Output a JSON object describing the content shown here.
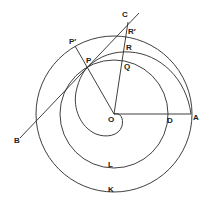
{
  "diagram": {
    "type": "geometric construction (Archimedean spiral with tangent)",
    "stroke_color": "#2a2a2a",
    "background": "#ffffff",
    "labels": {
      "C": "C",
      "R_prime": "R′",
      "R": "R",
      "Q": "Q",
      "P_prime": "P′",
      "P": "P",
      "O": "O",
      "D": "D",
      "A": "A",
      "B": "B",
      "L": "L",
      "K": "K"
    },
    "points": {
      "O": [
        114,
        114
      ],
      "A": [
        191,
        114
      ],
      "D": [
        166,
        114
      ],
      "P": [
        88,
        67
      ],
      "P_prime": [
        75,
        46
      ],
      "C": [
        127,
        20
      ],
      "R_prime": [
        128,
        36
      ],
      "R": [
        129,
        52
      ],
      "Q": [
        128,
        60
      ],
      "B": [
        20,
        138
      ]
    },
    "circles": [
      {
        "name": "outer-circle-K",
        "center": [
          114,
          114
        ],
        "radius": 78
      },
      {
        "name": "middle-circle-L",
        "center": [
          114,
          114
        ],
        "radius": 53
      }
    ]
  }
}
